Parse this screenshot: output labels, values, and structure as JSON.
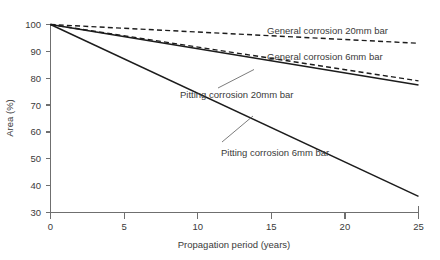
{
  "chart_data": {
    "type": "line",
    "title": "",
    "xlabel": "Propagation period (years)",
    "ylabel": "Area (%)",
    "xlim": [
      0,
      25
    ],
    "ylim": [
      30,
      100
    ],
    "xticks": [
      0,
      5,
      10,
      15,
      20,
      25
    ],
    "xtick_labels": [
      "0",
      "5",
      "10",
      "15",
      "20",
      "25"
    ],
    "yticks": [
      30,
      40,
      50,
      60,
      70,
      80,
      90,
      100
    ],
    "ytick_labels": [
      "30",
      "40",
      "50",
      "60",
      "70",
      "80",
      "90",
      "100"
    ],
    "grid": false,
    "legend_position": "inline-annotations",
    "x": [
      0,
      25
    ],
    "series": [
      {
        "name": "General corrosion 20mm bar",
        "style": "dashed",
        "color": "#1c1c1c",
        "values": [
          100,
          93
        ]
      },
      {
        "name": "General corrosion 6mm bar",
        "style": "dashed",
        "color": "#1c1c1c",
        "values": [
          100,
          79
        ]
      },
      {
        "name": "Pitting corrosion 20mm bar",
        "style": "solid",
        "color": "#1c1c1c",
        "values": [
          100,
          77.5
        ]
      },
      {
        "name": "Pitting corrosion 6mm bar",
        "style": "solid",
        "color": "#1c1c1c",
        "values": [
          100,
          36
        ]
      }
    ],
    "annotations": [
      {
        "text": "General corrosion 20mm bar",
        "x": 14.7,
        "y": 96.8
      },
      {
        "text": "General corrosion 6mm bar",
        "x": 14.7,
        "y": 89.2
      },
      {
        "text": "Pitting corrosion 20mm bar",
        "x": 8.1,
        "y": 81.8
      },
      {
        "text": "Pitting corrosion 6mm bar",
        "x": 12.6,
        "y": 51.8
      }
    ]
  },
  "axis": {
    "x_title": "Propagation period (years)",
    "y_title": "Area (%)",
    "x_tick_0": "0",
    "x_tick_1": "5",
    "x_tick_2": "10",
    "x_tick_3": "15",
    "x_tick_4": "20",
    "x_tick_5": "25",
    "y_tick_0": "30",
    "y_tick_1": "40",
    "y_tick_2": "50",
    "y_tick_3": "60",
    "y_tick_4": "70",
    "y_tick_5": "80",
    "y_tick_6": "90",
    "y_tick_7": "100"
  },
  "labels": {
    "general_20mm": "General corrosion 20mm bar",
    "general_6mm": "General corrosion 6mm bar",
    "pitting_20mm": "Pitting corrosion 20mm bar",
    "pitting_6mm": "Pitting corrosion 6mm bar"
  },
  "colors": {
    "line": "#1c1c1c",
    "axis": "#6f6f6f",
    "text": "#3a3a3a",
    "background": "#ffffff"
  }
}
